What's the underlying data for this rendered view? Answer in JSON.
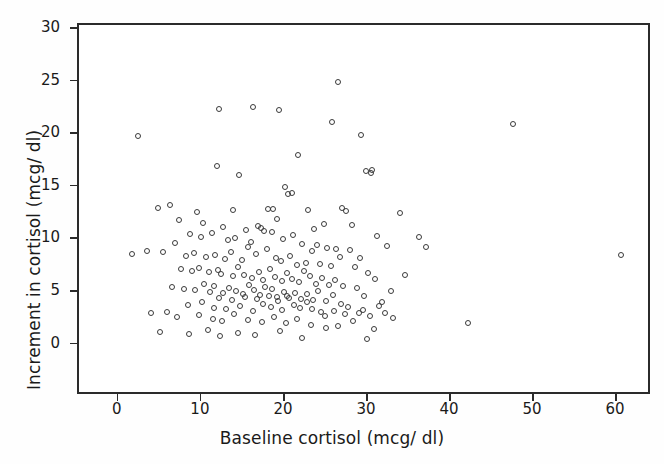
{
  "chart_data": {
    "type": "scatter",
    "title": "",
    "xlabel": "Baseline cortisol (mcg/ dl)",
    "ylabel": "Increment in cortisol (mcg/ dl)",
    "xlim": [
      -4.8,
      64.2
    ],
    "ylim": [
      -4.9,
      30.4
    ],
    "xticks": [
      0,
      10,
      20,
      30,
      40,
      50,
      60
    ],
    "xticklabels": [
      "0",
      "10",
      "20",
      "30",
      "40",
      "50",
      "60"
    ],
    "yticks": [
      0,
      5,
      10,
      15,
      20,
      25,
      30
    ],
    "yticklabels": [
      "0",
      "5",
      "10",
      "15",
      "20",
      "25",
      "30"
    ],
    "grid": false,
    "legend": null,
    "marker": "open-circle",
    "marker_color": "#3a3a3a",
    "n_points": 196,
    "x": [
      26.4,
      47.5,
      60.5,
      42.0,
      25.7,
      16.2,
      12.1,
      19.3,
      29.2,
      30.5,
      2.3,
      11.8,
      14.5,
      21.6,
      6.1,
      20.0,
      20.4,
      20.9,
      29.8,
      30.4,
      4.7,
      9.4,
      13.7,
      18.0,
      18.6,
      22.8,
      26.9,
      27.4,
      33.9,
      36.2,
      1.6,
      5.3,
      7.2,
      10.1,
      12.5,
      15.3,
      16.8,
      17.5,
      19.0,
      23.5,
      24.7,
      28.1,
      31.1,
      32.3,
      34.5,
      37.0,
      3.4,
      6.8,
      8.6,
      9.9,
      11.2,
      13.1,
      14.0,
      15.9,
      17.1,
      18.4,
      19.8,
      21.0,
      22.1,
      23.9,
      25.1,
      26.2,
      27.8,
      29.0,
      30.9,
      32.8,
      8.1,
      9.0,
      10.5,
      11.6,
      12.8,
      13.5,
      14.8,
      15.5,
      16.5,
      17.8,
      18.9,
      19.5,
      20.6,
      21.4,
      22.5,
      23.2,
      24.2,
      25.5,
      26.6,
      28.4,
      30.0,
      31.7,
      7.5,
      8.8,
      9.6,
      10.8,
      11.9,
      12.3,
      13.8,
      14.3,
      15.1,
      16.0,
      16.9,
      17.3,
      18.2,
      18.8,
      19.6,
      20.2,
      20.8,
      21.7,
      22.3,
      23.0,
      23.7,
      24.5,
      25.3,
      26.0,
      27.0,
      28.7,
      29.5,
      31.3,
      6.4,
      7.9,
      9.2,
      10.3,
      11.0,
      11.5,
      12.6,
      13.3,
      14.1,
      14.9,
      15.7,
      16.3,
      17.0,
      17.6,
      18.1,
      18.5,
      19.1,
      19.9,
      20.5,
      21.2,
      21.9,
      22.7,
      23.4,
      24.0,
      24.9,
      25.8,
      26.8,
      27.6,
      29.4,
      32.0,
      5.8,
      8.3,
      10.0,
      11.4,
      12.0,
      12.9,
      13.6,
      14.6,
      15.2,
      16.1,
      16.6,
      17.4,
      18.3,
      19.2,
      19.7,
      20.3,
      21.1,
      21.8,
      22.6,
      23.3,
      24.4,
      25.9,
      27.2,
      28.9,
      30.2,
      33.0,
      3.9,
      7.0,
      9.7,
      11.3,
      12.4,
      13.9,
      15.6,
      17.2,
      18.7,
      20.1,
      21.5,
      23.1,
      24.8,
      26.4,
      28.2,
      30.7,
      5.0,
      8.5,
      10.7,
      12.2,
      14.4,
      16.4,
      19.4,
      22.0,
      25.0,
      29.9
    ],
    "y": [
      25.0,
      21.0,
      8.5,
      2.0,
      21.2,
      22.6,
      22.4,
      22.3,
      19.9,
      16.6,
      19.8,
      17.0,
      16.1,
      18.0,
      13.3,
      15.0,
      14.3,
      14.4,
      16.5,
      16.3,
      13.0,
      12.6,
      12.8,
      12.9,
      12.9,
      12.8,
      13.0,
      12.7,
      12.5,
      10.2,
      8.6,
      8.8,
      11.8,
      11.6,
      11.2,
      10.9,
      11.3,
      10.8,
      11.9,
      11.0,
      11.5,
      11.4,
      10.3,
      9.4,
      6.6,
      9.3,
      8.9,
      9.7,
      10.5,
      10.2,
      10.6,
      9.9,
      10.1,
      9.8,
      11.1,
      10.7,
      10.0,
      10.4,
      9.6,
      9.5,
      9.2,
      9.1,
      9.0,
      8.2,
      6.2,
      5.1,
      8.4,
      8.7,
      8.3,
      8.5,
      8.1,
      8.8,
      8.0,
      9.3,
      8.6,
      9.1,
      8.2,
      7.9,
      8.4,
      7.6,
      7.8,
      8.9,
      7.7,
      7.5,
      8.3,
      7.4,
      6.8,
      4.0,
      7.2,
      7.0,
      7.3,
      6.9,
      7.1,
      6.7,
      6.5,
      7.4,
      6.6,
      6.3,
      6.9,
      6.1,
      7.2,
      6.4,
      6.0,
      6.8,
      6.2,
      5.9,
      7.0,
      6.5,
      5.8,
      6.3,
      5.7,
      6.1,
      5.6,
      5.4,
      4.6,
      3.7,
      5.5,
      5.3,
      5.2,
      5.8,
      5.0,
      5.6,
      4.9,
      5.4,
      5.1,
      4.8,
      5.7,
      5.2,
      4.7,
      5.5,
      4.6,
      5.3,
      4.5,
      5.0,
      4.4,
      4.9,
      4.3,
      4.8,
      4.2,
      5.1,
      4.1,
      4.7,
      3.9,
      3.6,
      3.3,
      3.0,
      3.1,
      3.8,
      4.0,
      3.5,
      4.4,
      3.4,
      4.2,
      3.7,
      4.5,
      3.2,
      4.3,
      3.9,
      3.6,
      4.1,
      3.3,
      4.6,
      3.8,
      3.5,
      4.0,
      3.4,
      3.1,
      3.2,
      2.9,
      3.0,
      2.7,
      2.5,
      3.0,
      2.6,
      2.8,
      2.4,
      2.2,
      2.9,
      2.3,
      2.1,
      2.6,
      2.0,
      2.4,
      1.9,
      2.7,
      1.8,
      2.2,
      1.5,
      1.2,
      1.0,
      1.4,
      0.8,
      1.1,
      0.9,
      1.3,
      0.6,
      1.6,
      0.5
    ]
  }
}
